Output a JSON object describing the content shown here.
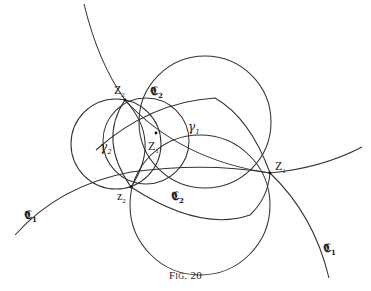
{
  "figure": {
    "caption_word": "Fig.",
    "caption_number": "20",
    "stroke_color": "#333333",
    "background_color": "#ffffff"
  },
  "points": {
    "Z2": {
      "x": 125,
      "y": 100,
      "label_main": "Z",
      "label_sub": "2"
    },
    "z1": {
      "x": 156,
      "y": 133,
      "label_main": "Z",
      "label_sub": "1"
    },
    "z2": {
      "x": 131,
      "y": 187,
      "label_main": "z",
      "label_sub": "2"
    },
    "Z1": {
      "x": 270,
      "y": 173,
      "label_main": "Z",
      "label_sub": "1"
    }
  },
  "labels": {
    "frak_C2_top": {
      "main": "𝕮",
      "sub": "2"
    },
    "frak_C2_bottom": {
      "main": "𝕮",
      "sub": "2"
    },
    "frak_C1_left": {
      "main": "𝕮",
      "sub": "1"
    },
    "frak_C1_right": {
      "main": "𝕮",
      "sub": "1"
    },
    "gamma1": {
      "main": "γ",
      "sub": "1"
    },
    "gamma2": {
      "main": "γ",
      "sub": "2"
    }
  },
  "curves": [
    {
      "name": "C1-great-arc",
      "description": "Arc through top edge, Z2, z1, Z1, to bottom right"
    },
    {
      "name": "long-arc-left-right",
      "description": "Arc from left edge through z2 region and Z1 to right edge"
    },
    {
      "name": "circle-C2-large",
      "description": "Large circle through Z2, z1 and Z1"
    },
    {
      "name": "circle-gamma2-left",
      "description": "Left circle through Z2 and z2"
    },
    {
      "name": "circle-gamma1-mid",
      "description": "Middle circle through Z2 and z2"
    },
    {
      "name": "lower-circle",
      "description": "Lower circle through z2 and Z1"
    },
    {
      "name": "arc-z2-Z1-inner",
      "description": "Inner arc from z2 to Z1"
    },
    {
      "name": "arc-Z2-Z1-upper",
      "description": "Upper arc from Z2 through z1 to Z1"
    }
  ]
}
